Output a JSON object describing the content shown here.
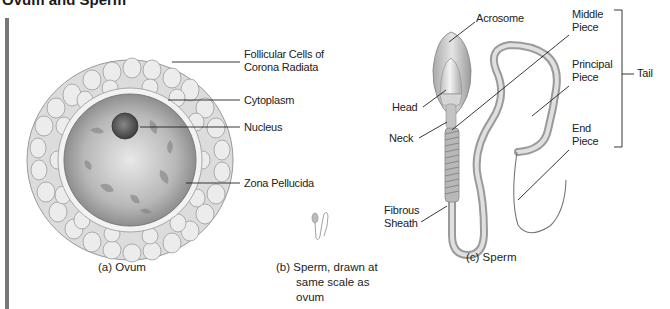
{
  "title": "Ovum and Sperm",
  "ovum": {
    "labels": {
      "follicular": [
        "Follicular Cells of",
        "Corona Radiata"
      ],
      "cytoplasm": "Cytoplasm",
      "nucleus": "Nucleus",
      "zona": "Zona Pellucida"
    },
    "caption": "(a) Ovum"
  },
  "sperm_small": {
    "caption": [
      "(b) Sperm, drawn at",
      "same scale as",
      "ovum"
    ]
  },
  "sperm": {
    "labels": {
      "acrosome": "Acrosome",
      "head": "Head",
      "neck": "Neck",
      "middle_piece": [
        "Middle",
        "Piece"
      ],
      "principal_piece": [
        "Principal",
        "Piece"
      ],
      "end_piece": [
        "End",
        "Piece"
      ],
      "fibrous_sheath": [
        "Fibrous",
        "Sheath"
      ],
      "tail": "Tail"
    },
    "caption": "(c) Sperm"
  },
  "colors": {
    "cell_fill": "#e6e6e6",
    "cell_stroke": "#9a9a9a",
    "cytoplasm": "#bdbdbd",
    "nucleus": "#5a5a5a",
    "leader_line": "#222222"
  }
}
